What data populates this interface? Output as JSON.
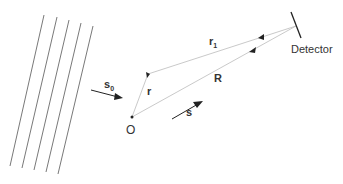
{
  "diagram": {
    "labels": {
      "incident": "s",
      "incident_sub": "0",
      "position": "r",
      "origin": "O",
      "scattered": "s",
      "distance": "R",
      "path": "r",
      "path_sub": "1",
      "detector": "Detector"
    },
    "colors": {
      "line": "#555555",
      "thin_line": "#bbbbbb",
      "arrow": "#222222"
    }
  }
}
